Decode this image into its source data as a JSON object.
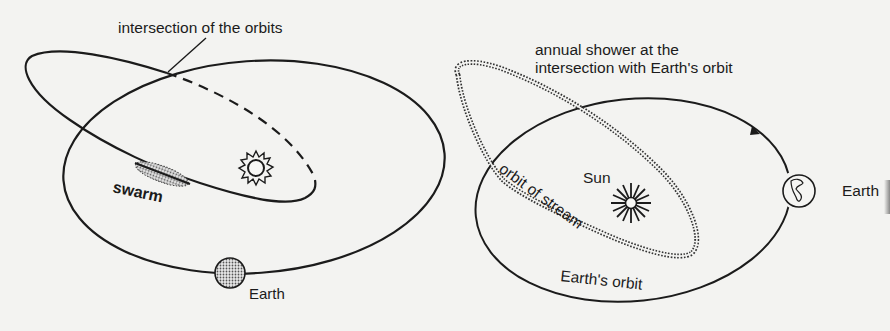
{
  "figure": {
    "panels": [
      {
        "id": "left",
        "labels": {
          "intersection": "intersection of the orbits",
          "swarm": "swarm",
          "earth": "Earth"
        },
        "icons": [
          "sun-icon",
          "earth-disc-icon",
          "swarm-cloud-icon"
        ]
      },
      {
        "id": "right",
        "labels": {
          "annual_shower_line1": "annual shower at the",
          "annual_shower_line2": "intersection with Earth's orbit",
          "sun": "Sun",
          "orbit_of_stream": "orbit of stream",
          "earths_orbit": "Earth's orbit",
          "earth": "Earth"
        },
        "icons": [
          "sun-rays-icon",
          "earth-globe-icon",
          "direction-arrow-icon"
        ]
      }
    ],
    "colors": {
      "ink": "#1b1b1b",
      "paper": "#f3f3f1",
      "earth_fill": "#9a9a9a"
    }
  }
}
